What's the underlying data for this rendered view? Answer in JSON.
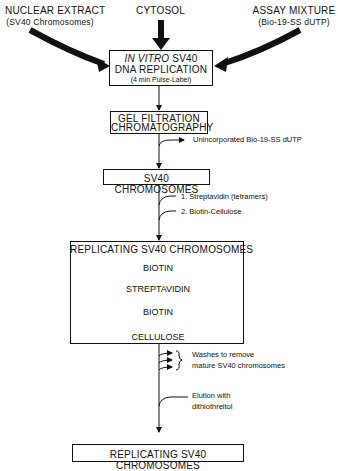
{
  "inputs": {
    "nuclear_extract": {
      "title": "NUCLEAR EXTRACT",
      "subtitle": "(SV40 Chromosomes)"
    },
    "cytosol": {
      "title": "CYTOSOL"
    },
    "assay_mixture": {
      "title": "ASSAY MIXTURE",
      "subtitle": "(Bio-19-SS dUTP)"
    }
  },
  "steps": {
    "replication": {
      "italic": "IN VITRO",
      "line1_rest": " SV40",
      "line2": "DNA REPLICATION",
      "line3": "(4 min Pulse-Label)"
    },
    "gel_filtration": {
      "line1": "GEL FILTRATION",
      "line2": "CHROMATOGRAPHY"
    },
    "sv40_chromosomes": {
      "label": "SV40 CHROMOSOMES"
    },
    "complex": {
      "title": "REPLICATING SV40 CHROMOSOMES",
      "biotin_top": "BIOTIN",
      "streptavidin": "STREPTAVIDIN",
      "biotin_bottom": "BIOTIN",
      "cellulose": "CELLULOSE"
    },
    "final": {
      "label": "REPLICATING SV40 CHROMOSOMES"
    }
  },
  "side_notes": {
    "unincorporated": "Unincorporated Bio-19-SS dUTP",
    "add1": "1. Streptavidin (tetramers)",
    "add2": "2. Biotin-Cellulose",
    "washes_line1": "Washes to remove",
    "washes_line2": "mature SV40 chromosomes",
    "elution_line1": "Elution with",
    "elution_line2": "dithiothreitol"
  }
}
